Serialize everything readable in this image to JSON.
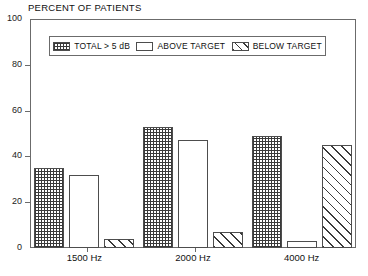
{
  "chart_data": {
    "type": "bar",
    "title": "PERCENT OF PATIENTS",
    "xlabel": "",
    "ylabel": "",
    "categories": [
      "1500 Hz",
      "2000 Hz",
      "4000 Hz"
    ],
    "series": [
      {
        "name": "TOTAL > 5 dB",
        "pattern": "crosshatch",
        "values": [
          35,
          53,
          49
        ]
      },
      {
        "name": "ABOVE TARGET",
        "pattern": "empty",
        "values": [
          32,
          47,
          3
        ]
      },
      {
        "name": "BELOW TARGET",
        "pattern": "diagonal",
        "values": [
          4,
          7,
          45
        ]
      }
    ],
    "ylim": [
      0,
      100
    ],
    "yticks": [
      0,
      20,
      40,
      60,
      80,
      100
    ],
    "ytick_labels": [
      "0",
      "20",
      "40",
      "60",
      "80",
      "100"
    ],
    "grid": false,
    "legend_position": "top-inside",
    "colors": {
      "line": "#4d4d4d",
      "frame": "#6b6b6b",
      "hatch": "#3a3a3a",
      "background": "#ffffff",
      "text": "#111111"
    }
  },
  "legend": {
    "items": [
      {
        "label": "TOTAL > 5 dB",
        "pattern": "crosshatch"
      },
      {
        "label": "ABOVE TARGET",
        "pattern": "empty"
      },
      {
        "label": "BELOW TARGET",
        "pattern": "diagonal"
      }
    ]
  }
}
